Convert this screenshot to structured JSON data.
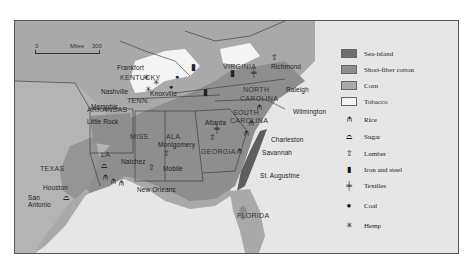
{
  "map": {
    "scale": {
      "start": "0",
      "unit": "Miles",
      "end": "300"
    },
    "states": [
      {
        "name": "KENTUCKY"
      },
      {
        "name": "TENN."
      },
      {
        "name": "VIRGINIA"
      },
      {
        "name": "NORTH CAROLINA"
      },
      {
        "name": "SOUTH CAROLINA"
      },
      {
        "name": "GEORGIA"
      },
      {
        "name": "ALA."
      },
      {
        "name": "MISS."
      },
      {
        "name": "ARKANSAS"
      },
      {
        "name": "LA"
      },
      {
        "name": "TEXAS"
      },
      {
        "name": "FLORIDA"
      }
    ],
    "state_labels": {
      "kentucky": "KENTUCKY",
      "tenn": "TENN.",
      "virginia": "VIRGINIA",
      "north": "NORTH",
      "carolina_n": "CAROLINA",
      "south": "SOUTH",
      "carolina_s": "CAROLINA",
      "georgia": "GEORGIA",
      "ala": "ALA.",
      "miss": "MISS.",
      "arkansas": "ARKANSAS",
      "la": "LA",
      "texas": "TEXAS",
      "florida": "FLORIDA"
    },
    "cities": {
      "frankfort": "Frankfort",
      "nashville": "Nashville",
      "knoxville": "Knoxville",
      "memphis": "Memphis",
      "richmond": "Richmond",
      "raleigh": "Raleigh",
      "wilmington": "Wilmington",
      "charleston": "Charleston",
      "savannah": "Savannah",
      "st_augustine": "St. Augustine",
      "atlanta": "Atlanta",
      "montgomery": "Montgomery",
      "mobile": "Mobile",
      "natchez": "Natchez",
      "new_orleans": "New Orleans",
      "little_rock": "Little Rock",
      "houston": "Houston",
      "san": "San",
      "antonio": "Antonio"
    }
  },
  "legend": {
    "areas": [
      {
        "label": "Sea-island",
        "color": "#6e6e6e"
      },
      {
        "label": "Short-fiber cotton",
        "color": "#8e8e8e"
      },
      {
        "label": "Corn",
        "color": "#a9a9a9"
      },
      {
        "label": "Tobacco",
        "color": "#f4f4f4"
      }
    ],
    "symbols": [
      {
        "label": "Rice",
        "icon": "rice-icon",
        "glyph": "⫛"
      },
      {
        "label": "Sugar",
        "icon": "sugar-icon",
        "glyph": "⌓"
      },
      {
        "label": "Lumber",
        "icon": "lumber-icon",
        "glyph": "⇧"
      },
      {
        "label": "Iron and steel",
        "icon": "iron-steel-icon",
        "glyph": "▮"
      },
      {
        "label": "Textiles",
        "icon": "textiles-icon",
        "glyph": "╪"
      },
      {
        "label": "Coal",
        "icon": "coal-icon",
        "glyph": "●"
      },
      {
        "label": "Hemp",
        "icon": "hemp-icon",
        "glyph": "✳"
      }
    ]
  }
}
